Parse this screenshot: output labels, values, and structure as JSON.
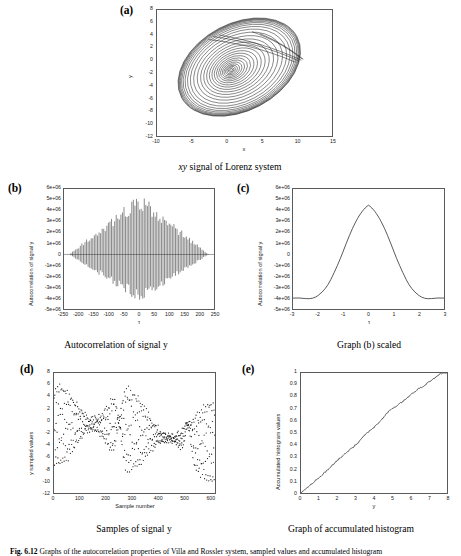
{
  "figure": {
    "caption_prefix": "Fig. 6.12",
    "caption_text": "Graphs of the autocorrelation properties of Villa and Rossler system, sampled values and accumulated histogram"
  },
  "panels": [
    {
      "id": "a",
      "label": "(a)",
      "caption": "xy signal of Lorenz system",
      "caption_italic_prefix": "xy",
      "caption_rest": " signal of Lorenz system",
      "xlabel": "x",
      "ylabel": "y",
      "xticks": [
        "-10",
        "-5",
        "0",
        "5",
        "10",
        "15"
      ],
      "yticks": [
        "8",
        "6",
        "4",
        "2",
        "0",
        "-2",
        "-4",
        "-6",
        "-8",
        "-10",
        "-12"
      ]
    },
    {
      "id": "b",
      "label": "(b)",
      "caption": "Autocorrelation of signal y",
      "xlabel": "τ",
      "ylabel": "Autocorrelation of signal y",
      "xticks": [
        "-250",
        "-200",
        "-150",
        "-100",
        "-50",
        "0",
        "50",
        "100",
        "150",
        "200",
        "250"
      ],
      "yticks": [
        "6e+06",
        "5e+06",
        "4e+06",
        "3e+06",
        "2e+06",
        "1e+06",
        "0",
        "-1e+06",
        "-2e+06",
        "-3e+06",
        "-4e+06",
        "-5e+06"
      ]
    },
    {
      "id": "c",
      "label": "(c)",
      "caption": "Graph (b) scaled",
      "xlabel": "τ",
      "ylabel": "Autocorrelation of signal y",
      "xticks": [
        "-3",
        "-2",
        "-1",
        "0",
        "1",
        "2",
        "3"
      ],
      "yticks": [
        "6e+06",
        "5e+06",
        "4e+06",
        "3e+06",
        "2e+06",
        "1e+06",
        "0",
        "-1e+06",
        "-2e+06",
        "-3e+06",
        "-4e+06",
        "-5e+06"
      ]
    },
    {
      "id": "d",
      "label": "(d)",
      "caption": "Samples of signal y",
      "xlabel": "Sample number",
      "ylabel": "y sampled values",
      "xticks": [
        "0",
        "100",
        "200",
        "300",
        "400",
        "500",
        "600"
      ],
      "yticks": [
        "8",
        "6",
        "4",
        "2",
        "0",
        "-2",
        "-4",
        "-6",
        "-8",
        "-10",
        "-12"
      ]
    },
    {
      "id": "e",
      "label": "(e)",
      "caption": "Graph of accumulated histogram",
      "xlabel": "y",
      "ylabel": "Accumulated histogram values",
      "xticks": [
        "0",
        "1",
        "2",
        "3",
        "4",
        "5",
        "6",
        "7",
        "8"
      ],
      "yticks": [
        "1",
        "0.9",
        "0.8",
        "0.7",
        "0.6",
        "0.5",
        "0.4",
        "0.3",
        "0.2",
        "0.1",
        "0"
      ]
    }
  ],
  "chart_data": [
    {
      "id": "a",
      "type": "line",
      "title": "xy signal of Lorenz system",
      "xlabel": "x",
      "ylabel": "y",
      "xlim": [
        -10,
        15
      ],
      "ylim": [
        -12,
        8
      ],
      "xticks": [
        -10,
        -5,
        0,
        5,
        10,
        15
      ],
      "yticks": [
        8,
        6,
        4,
        2,
        0,
        -2,
        -4,
        -6,
        -8,
        -10,
        -12
      ],
      "grid": false,
      "legend": "none",
      "description": "Phase-plane trajectory of a Lorenz-type system: an outward-growing spiral of many nested closed loops centred near (0.5, -1), tilted so the major axis runs from upper-left to lower-right, with outermost loops reaching about x = -9 to x = 11.5 and y = -11 to y = 7.5, plus a few nearly straight chords cutting across the upper-right of the attractor.",
      "center": [
        0.5,
        -1.2
      ],
      "n_turns": 26,
      "outer_extent": {
        "x_min": -9.0,
        "x_max": 11.5,
        "y_min": -11.0,
        "y_max": 7.5
      },
      "tilt_deg": -28
    },
    {
      "id": "b",
      "type": "line",
      "title": "Autocorrelation of signal y",
      "xlabel": "τ",
      "ylabel": "Autocorrelation of signal y",
      "xlim": [
        -250,
        250
      ],
      "ylim": [
        -5000000,
        6000000
      ],
      "xticks": [
        -250,
        -200,
        -150,
        -100,
        -50,
        0,
        50,
        100,
        150,
        200,
        250
      ],
      "yticks": [
        6000000,
        5000000,
        4000000,
        3000000,
        2000000,
        1000000,
        0,
        -1000000,
        -2000000,
        -3000000,
        -4000000,
        -5000000
      ],
      "grid": false,
      "legend": "none",
      "description": "Densely oscillating autocorrelation with a diamond (triangular) envelope: amplitude grows roughly linearly from near zero at tau = -230 to a maximum at tau = 0 and decays back to near zero by tau = +230. Peak positive value about 5.1e+06, peak negative about -4.1e+06; oscillation period roughly 5 samples.",
      "envelope_peak_positive": 5100000,
      "envelope_peak_negative": -4100000,
      "envelope_half_width": 232,
      "oscillation_period": 5.2
    },
    {
      "id": "c",
      "type": "line",
      "title": "Graph (b) scaled",
      "xlabel": "τ",
      "ylabel": "Autocorrelation of signal y",
      "xlim": [
        -3,
        3
      ],
      "ylim": [
        -5000000,
        6000000
      ],
      "xticks": [
        -3,
        -2,
        -1,
        0,
        1,
        2,
        3
      ],
      "yticks": [
        6000000,
        5000000,
        4000000,
        3000000,
        2000000,
        1000000,
        0,
        -1000000,
        -2000000,
        -3000000,
        -4000000,
        -5000000
      ],
      "grid": false,
      "legend": "none",
      "description": "Single smooth cosine-like lobe: a bell/hump peaking at about 5.15e+06 at tau = 0, falling monotonically on both sides to about -4.0e+06 at tau = +/-3, crossing zero near tau = +/-1.45.",
      "x": [
        -3,
        -2.75,
        -2.5,
        -2.25,
        -2,
        -1.75,
        -1.5,
        -1.25,
        -1,
        -0.75,
        -0.5,
        -0.25,
        0,
        0.25,
        0.5,
        0.75,
        1,
        1.25,
        1.5,
        1.75,
        2,
        2.25,
        2.5,
        2.75,
        3
      ],
      "y": [
        -4000000,
        -4050000,
        -3900000,
        -3500000,
        -2900000,
        -2050000,
        -1050000,
        100000,
        1300000,
        2500000,
        3600000,
        4600000,
        5150000,
        4600000,
        3600000,
        2500000,
        1300000,
        100000,
        -1050000,
        -2050000,
        -2900000,
        -3500000,
        -3900000,
        -4050000,
        -4000000
      ]
    },
    {
      "id": "d",
      "type": "scatter",
      "title": "Samples of signal y",
      "xlabel": "Sample number",
      "ylabel": "y sampled values",
      "xlim": [
        0,
        620
      ],
      "ylim": [
        -12,
        8
      ],
      "xticks": [
        0,
        100,
        200,
        300,
        400,
        500,
        600
      ],
      "yticks": [
        8,
        6,
        4,
        2,
        0,
        -2,
        -4,
        -6,
        -8,
        -10,
        -12
      ],
      "grid": false,
      "legend": "none",
      "n_points": 620,
      "marker": "dot",
      "description": "Scatter of about 620 sampled y values versus sample index. The points trace aliased, interleaved sinusoid-like arcs filling the band y = -12 to y = 8, with visible dense knots (near-zero crossings) around sample 250 and sample 515 and looping arc families repeating roughly every 250 samples."
    },
    {
      "id": "e",
      "type": "line",
      "title": "Graph of accumulated histogram",
      "xlabel": "y",
      "ylabel": "Accumulated histogram values",
      "xlim": [
        0,
        8
      ],
      "ylim": [
        0,
        1
      ],
      "xticks": [
        0,
        1,
        2,
        3,
        4,
        5,
        6,
        7,
        8
      ],
      "yticks": [
        0,
        0.1,
        0.2,
        0.3,
        0.4,
        0.5,
        0.6,
        0.7,
        0.8,
        0.9,
        1
      ],
      "grid": false,
      "legend": "none",
      "description": "Accumulated (cumulative) histogram rising almost linearly, with small stair-step irregularities, from (0, 0) to (7.8, 1.0) then flat to x = 8.",
      "x": [
        0,
        0.4,
        0.8,
        1.2,
        1.6,
        2.0,
        2.4,
        2.8,
        3.2,
        3.6,
        4.0,
        4.4,
        4.8,
        5.2,
        5.6,
        6.0,
        6.4,
        6.8,
        7.2,
        7.6,
        7.8,
        8.0
      ],
      "y": [
        0.0,
        0.055,
        0.105,
        0.155,
        0.215,
        0.275,
        0.325,
        0.375,
        0.43,
        0.5,
        0.545,
        0.61,
        0.68,
        0.72,
        0.765,
        0.815,
        0.865,
        0.9,
        0.945,
        0.99,
        1.0,
        1.0
      ]
    }
  ]
}
